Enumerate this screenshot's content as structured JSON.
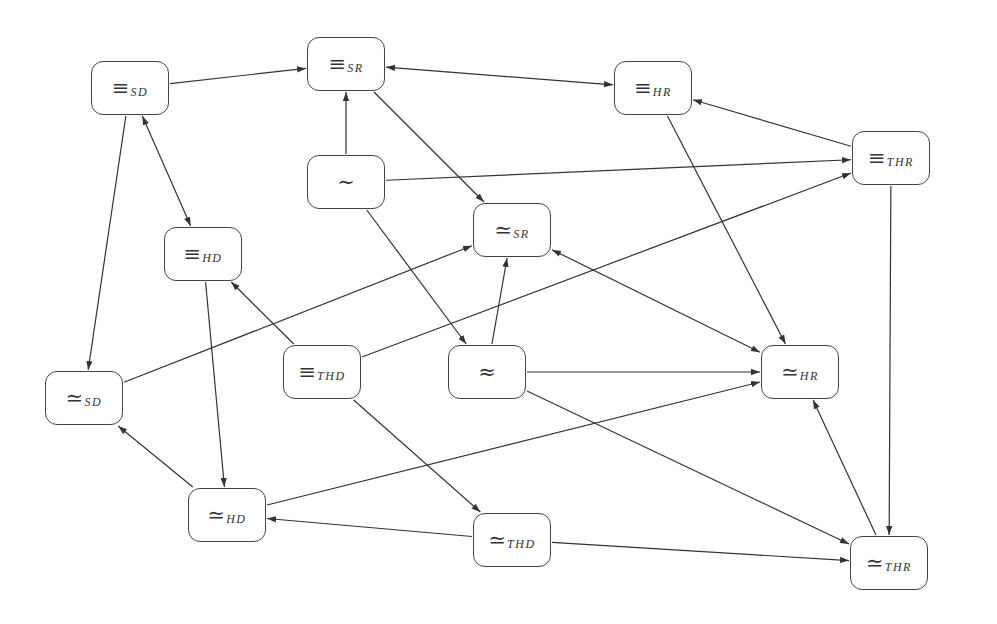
{
  "diagram": {
    "type": "directed-graph",
    "colors": {
      "stroke": "#333333",
      "node_border": "#444444",
      "background": "#ffffff"
    },
    "node_size": {
      "w": 78,
      "h": 54
    },
    "nodes": [
      {
        "id": "eqSD",
        "symbol": "≡",
        "sub": "SD",
        "cx": 130,
        "cy": 88
      },
      {
        "id": "eqSR",
        "symbol": "≡",
        "sub": "SR",
        "cx": 346,
        "cy": 64
      },
      {
        "id": "eqHR",
        "symbol": "≡",
        "sub": "HR",
        "cx": 653,
        "cy": 88
      },
      {
        "id": "eqTHR",
        "symbol": "≡",
        "sub": "THR",
        "cx": 891,
        "cy": 158
      },
      {
        "id": "sim",
        "symbol": "∼",
        "sub": "",
        "cx": 346,
        "cy": 182
      },
      {
        "id": "seSR",
        "symbol": "≃",
        "sub": "SR",
        "cx": 512,
        "cy": 230
      },
      {
        "id": "eqHD",
        "symbol": "≡",
        "sub": "HD",
        "cx": 203,
        "cy": 254
      },
      {
        "id": "eqTHD",
        "symbol": "≡",
        "sub": "THD",
        "cx": 322,
        "cy": 372
      },
      {
        "id": "approx",
        "symbol": "≈",
        "sub": "",
        "cx": 487,
        "cy": 372
      },
      {
        "id": "seHR",
        "symbol": "≃",
        "sub": "HR",
        "cx": 800,
        "cy": 372
      },
      {
        "id": "seSD",
        "symbol": "≃",
        "sub": "SD",
        "cx": 84,
        "cy": 398
      },
      {
        "id": "seHD",
        "symbol": "≃",
        "sub": "HD",
        "cx": 227,
        "cy": 515
      },
      {
        "id": "seTHD",
        "symbol": "≃",
        "sub": "THD",
        "cx": 512,
        "cy": 540
      },
      {
        "id": "seTHR",
        "symbol": "≃",
        "sub": "THR",
        "cx": 889,
        "cy": 563
      }
    ],
    "edges": [
      {
        "from": "eqSD",
        "to": "eqSR",
        "bidirectional": false
      },
      {
        "from": "eqSR",
        "to": "eqHR",
        "bidirectional": true
      },
      {
        "from": "sim",
        "to": "eqSR",
        "bidirectional": false
      },
      {
        "from": "eqSR",
        "to": "seSR",
        "bidirectional": false
      },
      {
        "from": "eqSD",
        "to": "eqHD",
        "bidirectional": true
      },
      {
        "from": "eqSD",
        "to": "seSD",
        "bidirectional": false
      },
      {
        "from": "sim",
        "to": "eqTHR",
        "bidirectional": false
      },
      {
        "from": "sim",
        "to": "approx",
        "bidirectional": false
      },
      {
        "from": "eqTHR",
        "to": "eqHR",
        "bidirectional": false
      },
      {
        "from": "eqHR",
        "to": "seHR",
        "bidirectional": false
      },
      {
        "from": "eqTHR",
        "to": "seTHR",
        "bidirectional": false
      },
      {
        "from": "seSD",
        "to": "seSR",
        "bidirectional": false
      },
      {
        "from": "eqTHD",
        "to": "eqHD",
        "bidirectional": false
      },
      {
        "from": "eqTHD",
        "to": "eqTHR",
        "bidirectional": false
      },
      {
        "from": "eqTHD",
        "to": "seTHD",
        "bidirectional": false
      },
      {
        "from": "eqHD",
        "to": "seHD",
        "bidirectional": false
      },
      {
        "from": "approx",
        "to": "seSR",
        "bidirectional": false
      },
      {
        "from": "seSR",
        "to": "seHR",
        "bidirectional": true
      },
      {
        "from": "approx",
        "to": "seHR",
        "bidirectional": false
      },
      {
        "from": "approx",
        "to": "seTHR",
        "bidirectional": false
      },
      {
        "from": "seHD",
        "to": "seSD",
        "bidirectional": false
      },
      {
        "from": "seHD",
        "to": "seHR",
        "bidirectional": false
      },
      {
        "from": "seTHD",
        "to": "seHD",
        "bidirectional": false
      },
      {
        "from": "seTHD",
        "to": "seTHR",
        "bidirectional": false
      },
      {
        "from": "seTHR",
        "to": "seHR",
        "bidirectional": false
      }
    ]
  }
}
